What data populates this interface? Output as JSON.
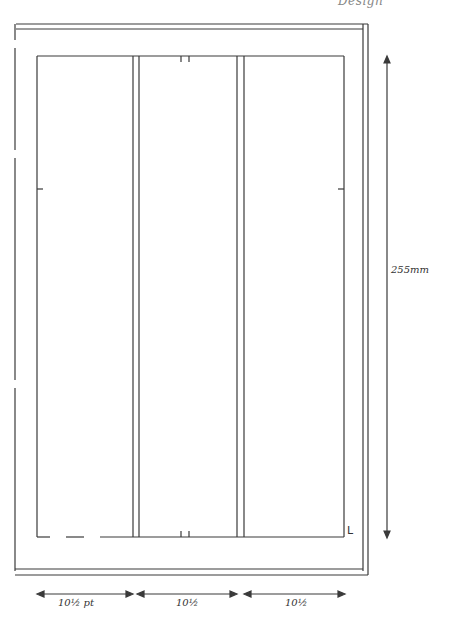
{
  "header": {
    "title": "Design"
  },
  "diagram": {
    "type": "page-layout-grid",
    "columns": 3,
    "dimensions": {
      "height_label": "255mm",
      "column_widths": [
        "10½ pt",
        "10½",
        "10½"
      ]
    },
    "corner_mark": "L"
  },
  "colors": {
    "line": "#3a3a3a",
    "background": "#ffffff"
  }
}
